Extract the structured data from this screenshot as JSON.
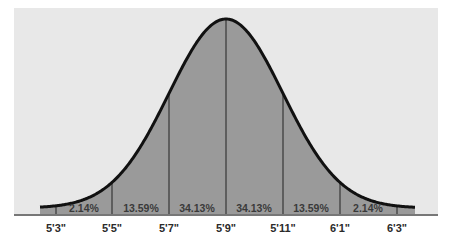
{
  "chart_data": {
    "type": "area",
    "title": "",
    "xlabel": "",
    "ylabel": "",
    "distribution": "normal",
    "mean_label": "5'9\"",
    "x_tick_labels": [
      "5'3\"",
      "5'5\"",
      "5'7\"",
      "5'9\"",
      "5'11\"",
      "6'1\"",
      "6'3\""
    ],
    "x_tick_inches": [
      63,
      65,
      67,
      69,
      71,
      73,
      75
    ],
    "segments": [
      {
        "from": "5'3\"",
        "to": "5'5\"",
        "percent": "2.14%"
      },
      {
        "from": "5'5\"",
        "to": "5'7\"",
        "percent": "13.59%"
      },
      {
        "from": "5'7\"",
        "to": "5'9\"",
        "percent": "34.13%"
      },
      {
        "from": "5'9\"",
        "to": "5'11\"",
        "percent": "34.13%"
      },
      {
        "from": "5'11\"",
        "to": "6'1\"",
        "percent": "13.59%"
      },
      {
        "from": "6'1\"",
        "to": "6'3\"",
        "percent": "2.14%"
      }
    ],
    "values": [
      2.14,
      13.59,
      34.13,
      34.13,
      13.59,
      2.14
    ],
    "grid": false,
    "legend": "none",
    "colors": {
      "panel": "#e8e8e8",
      "fill": "#9a9a9a",
      "curve": "#111111",
      "axis": "#777777"
    }
  }
}
